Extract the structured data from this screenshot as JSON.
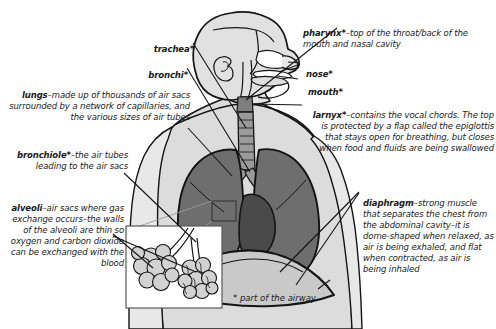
{
  "diagram": {
    "footnote": "* part of the airway",
    "colors": {
      "background": "#ffffff",
      "body_fill": "#dcdcdc",
      "body_fill_light": "#e8e8e8",
      "lung_fill": "#6e6e6e",
      "heart_fill": "#4a4a4a",
      "airway_fill": "#8a8a8a",
      "outline": "#141414",
      "text": "#1a1a1a",
      "inset_fill": "#ffffff",
      "alveoli_fill": "#d2d2d2"
    }
  },
  "labels": {
    "trachea": {
      "term": "trachea",
      "star": "*",
      "text": ""
    },
    "bronchi": {
      "term": "bronchi",
      "star": "*",
      "text": ""
    },
    "lungs": {
      "term": "lungs",
      "star": "",
      "text": "–made up of thousands of air sacs surrounded by a network of capillaries, and the various sizes of air tubes"
    },
    "bronchiole": {
      "term": "bronchiole",
      "star": "*",
      "text": "–the air tubes leading to the air sacs"
    },
    "alveoli": {
      "term": "alveoli",
      "star": "",
      "text": "–air sacs where gas exchange occurs–the walls of the alveoli are thin so oxygen and carbon dioxide can be exchanged with the blood"
    },
    "pharynx": {
      "term": "pharynx",
      "star": "*",
      "text": "–top of the throat/back of the mouth and nasal cavity"
    },
    "nose": {
      "term": "nose",
      "star": "*",
      "text": ""
    },
    "mouth": {
      "term": "mouth",
      "star": "*",
      "text": ""
    },
    "larynx": {
      "term": "larnyx",
      "star": "*",
      "text": "–contains the vocal chords. The top is protected by a flap called the epiglottis that stays open for breathing, but closes when food and fluids are being swallowed"
    },
    "diaphragm": {
      "term": "diaphragm",
      "star": "",
      "text": "–strong muscle that separates the chest from the abdominal cavity–it is dome-shaped when relaxed, as air is being exhaled, and flat when contracted, as air is being inhaled"
    }
  }
}
